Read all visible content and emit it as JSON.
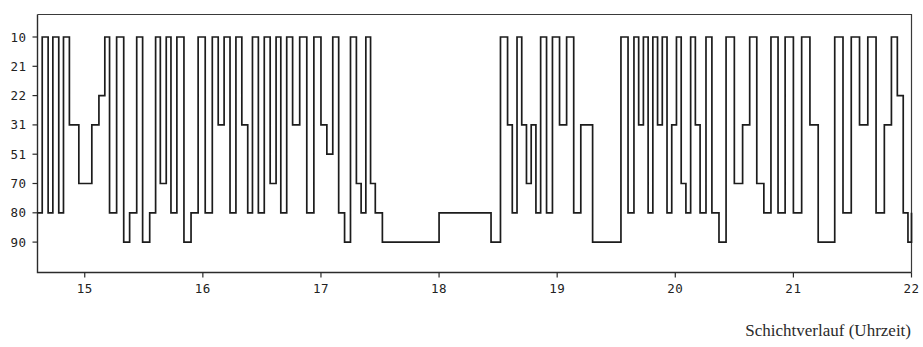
{
  "caption": "Schichtverlauf (Uhrzeit)",
  "chart_data": {
    "type": "line",
    "title": "",
    "subtitle": "",
    "xlabel": "Schichtverlauf (Uhrzeit)",
    "ylabel": "",
    "grid": false,
    "legend": null,
    "annotations": [],
    "x_tick_labels": [
      "15",
      "16",
      "17",
      "18",
      "19",
      "20",
      "21",
      "22"
    ],
    "x_ticks": [
      15,
      16,
      17,
      18,
      19,
      20,
      21,
      22
    ],
    "xlim": [
      14.6,
      22.0
    ],
    "y_tick_labels": [
      "10",
      "21",
      "22",
      "31",
      "51",
      "70",
      "80",
      "90"
    ],
    "y_categories": [
      10,
      21,
      22,
      31,
      51,
      70,
      80,
      90
    ],
    "y_order": "categorical, top to bottom: 10, 21, 22, 31, 51, 70, 80, 90",
    "ylim_note": "categorical axis, 8 evenly spaced levels",
    "series": [
      {
        "name": "Schichtverlauf",
        "step_type": "post",
        "x": [
          14.6,
          14.64,
          14.69,
          14.73,
          14.78,
          14.82,
          14.87,
          14.95,
          15.06,
          15.12,
          15.17,
          15.21,
          15.27,
          15.33,
          15.38,
          15.44,
          15.49,
          15.55,
          15.6,
          15.64,
          15.69,
          15.73,
          15.78,
          15.84,
          15.9,
          15.96,
          16.02,
          16.08,
          16.13,
          16.18,
          16.23,
          16.28,
          16.33,
          16.38,
          16.42,
          16.47,
          16.52,
          16.57,
          16.62,
          16.66,
          16.71,
          16.76,
          16.82,
          16.88,
          16.94,
          17.0,
          17.05,
          17.1,
          17.15,
          17.2,
          17.25,
          17.3,
          17.34,
          17.38,
          17.42,
          17.46,
          17.52,
          17.62,
          18.0,
          18.28,
          18.44,
          18.52,
          18.58,
          18.62,
          18.66,
          18.7,
          18.74,
          18.78,
          18.82,
          18.86,
          18.91,
          18.96,
          19.02,
          19.08,
          19.14,
          19.2,
          19.3,
          19.42,
          19.54,
          19.6,
          19.65,
          19.69,
          19.73,
          19.77,
          19.81,
          19.85,
          19.89,
          19.93,
          19.97,
          20.01,
          20.05,
          20.09,
          20.13,
          20.17,
          20.21,
          20.26,
          20.31,
          20.37,
          20.43,
          20.5,
          20.57,
          20.63,
          20.69,
          20.75,
          20.81,
          20.87,
          20.93,
          21.0,
          21.07,
          21.14,
          21.21,
          21.28,
          21.35,
          21.42,
          21.49,
          21.56,
          21.63,
          21.7,
          21.77,
          21.83,
          21.88,
          21.93,
          21.97,
          22.0
        ],
        "y": [
          80,
          10,
          80,
          10,
          80,
          10,
          31,
          70,
          31,
          22,
          10,
          80,
          10,
          90,
          80,
          10,
          90,
          80,
          10,
          70,
          10,
          80,
          10,
          90,
          80,
          10,
          80,
          10,
          31,
          10,
          80,
          10,
          31,
          80,
          10,
          80,
          10,
          70,
          10,
          80,
          10,
          31,
          10,
          80,
          10,
          31,
          51,
          10,
          80,
          90,
          10,
          70,
          80,
          10,
          70,
          80,
          90,
          90,
          80,
          80,
          90,
          10,
          31,
          80,
          10,
          31,
          70,
          31,
          80,
          10,
          80,
          10,
          31,
          10,
          80,
          31,
          90,
          90,
          10,
          80,
          10,
          31,
          10,
          80,
          10,
          31,
          10,
          80,
          31,
          10,
          70,
          80,
          10,
          31,
          80,
          10,
          80,
          90,
          10,
          70,
          31,
          10,
          70,
          80,
          10,
          80,
          10,
          80,
          10,
          31,
          90,
          90,
          10,
          80,
          10,
          31,
          10,
          80,
          31,
          10,
          22,
          80,
          90,
          80
        ]
      }
    ]
  }
}
